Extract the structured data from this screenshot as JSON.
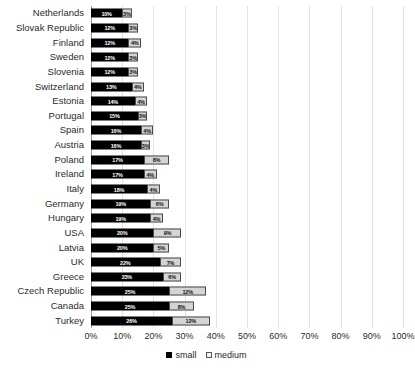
{
  "chart_data": {
    "type": "bar",
    "orientation": "horizontal",
    "stacked": true,
    "title": "",
    "xlabel": "",
    "ylabel": "",
    "xlim": [
      0,
      100
    ],
    "xunit": "%",
    "grid": true,
    "legend_position": "bottom",
    "categories": [
      "Netherlands",
      "Slovak Republic",
      "Finland",
      "Sweden",
      "Slovenia",
      "Switzerland",
      "Estonia",
      "Portugal",
      "Spain",
      "Austria",
      "Poland",
      "Ireland",
      "Italy",
      "Germany",
      "Hungary",
      "USA",
      "Latvia",
      "UK",
      "Greece",
      "Czech Republic",
      "Canada",
      "Turkey"
    ],
    "series": [
      {
        "name": "small",
        "color": "#000000",
        "values": [
          10,
          12,
          12,
          12,
          12,
          13,
          14,
          15,
          16,
          16,
          17,
          17,
          18,
          19,
          19,
          20,
          20,
          22,
          23,
          25,
          25,
          26
        ],
        "labels": [
          "10%",
          "12%",
          "12%",
          "12%",
          "12%",
          "13%",
          "14%",
          "15%",
          "16%",
          "16%",
          "17%",
          "17%",
          "18%",
          "19%",
          "19%",
          "20%",
          "20%",
          "22%",
          "23%",
          "25%",
          "25%",
          "26%"
        ]
      },
      {
        "name": "medium",
        "color": "#d4d4d4",
        "values": [
          3,
          3,
          4,
          3,
          3,
          4,
          4,
          3,
          4,
          3,
          8,
          4,
          4,
          6,
          4,
          9,
          5,
          7,
          6,
          12,
          8,
          12
        ],
        "labels": [
          "3%",
          "3%",
          "4%",
          "3%",
          "3%",
          "4%",
          "4%",
          "3%",
          "4%",
          "3%",
          "8%",
          "4%",
          "4%",
          "6%",
          "4%",
          "9%",
          "5%",
          "7%",
          "6%",
          "12%",
          "8%",
          "12%"
        ]
      }
    ],
    "xticks": [
      0,
      10,
      20,
      30,
      40,
      50,
      60,
      70,
      80,
      90,
      100
    ],
    "xticklabels": [
      "0%",
      "10%",
      "20%",
      "30%",
      "40%",
      "50%",
      "60%",
      "70%",
      "80%",
      "90%",
      "100%"
    ]
  },
  "legend": {
    "items": [
      {
        "label": "small",
        "swatch": "small-swatch-icon"
      },
      {
        "label": "medium",
        "swatch": "medium-swatch-icon"
      }
    ]
  }
}
